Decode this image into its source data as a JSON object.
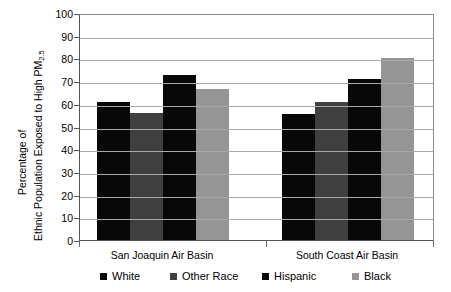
{
  "chart_data": {
    "type": "bar",
    "title": "",
    "xlabel": "",
    "ylabel_line1": "Percentage of",
    "ylabel_line2": "Ethnic Population Exposed to High PM",
    "ylabel_sub": "2.5",
    "ylim": [
      0,
      100
    ],
    "ytick_step": 10,
    "yticks": [
      "100",
      "90",
      "80",
      "70",
      "60",
      "50",
      "40",
      "30",
      "20",
      "10",
      "0"
    ],
    "grid": true,
    "legend_position": "bottom",
    "categories": [
      "San Joaquin Air Basin",
      "South Coast Air Basin"
    ],
    "series": [
      {
        "name": "White",
        "color": "#080808",
        "values": [
          61.0,
          55.5
        ]
      },
      {
        "name": "Other Race",
        "color": "#404040",
        "values": [
          56.0,
          61.0
        ]
      },
      {
        "name": "Hispanic",
        "color": "#080808",
        "values": [
          72.5,
          71.0
        ]
      },
      {
        "name": "Black",
        "color": "#959595",
        "values": [
          66.5,
          80.0
        ]
      }
    ]
  },
  "axis": {
    "y_title_part1": "Percentage of",
    "y_title_part2": "Ethnic Population Exposed to High PM",
    "y_title_subscript": "2.5"
  },
  "legend": {
    "items": [
      {
        "label": "White",
        "color": "#080808"
      },
      {
        "label": "Other Race",
        "color": "#404040"
      },
      {
        "label": "Hispanic",
        "color": "#080808"
      },
      {
        "label": "Black",
        "color": "#959595"
      }
    ]
  }
}
